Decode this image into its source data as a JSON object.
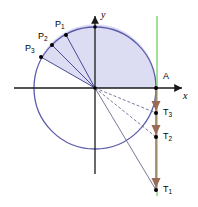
{
  "figure": {
    "type": "unit-circle-tangent-diagram",
    "width": 198,
    "height": 207,
    "background": "#ffffff"
  },
  "axes": {
    "x_label": "x",
    "y_label": "y",
    "origin": {
      "x": 95,
      "y": 88
    },
    "x_axis": {
      "x1": 14,
      "y1": 88,
      "x2": 186,
      "y2": 88
    },
    "y_axis": {
      "x1": 95,
      "y1": 172,
      "x2": 95,
      "y2": 12
    },
    "color": "#1a1a1a"
  },
  "circle": {
    "center_x": 95,
    "center_y": 88,
    "radius": 61,
    "stroke": "#5b5bac",
    "fill": "none"
  },
  "sector": {
    "fill": "#dcdcf2",
    "description": "shaded sector from P3 counterclockwise through top to point A"
  },
  "colors": {
    "circle_stroke": "#5b5bac",
    "sector_fill": "#dcdcf2",
    "radius_line": "#4a4a96",
    "dashed_ray": "#6a6a8c",
    "tangent_line": "#a0785f",
    "arrow_fill": "#9a6a55",
    "vertical_green": "#66cc55",
    "axis": "#1a1a1a",
    "point_dot": "#000000",
    "label_text": "#000000"
  },
  "points": [
    {
      "id": "P1",
      "label": "P",
      "sub": "1",
      "x": 66,
      "y": 35,
      "label_x": 55,
      "label_y": 20
    },
    {
      "id": "P2",
      "label": "P",
      "sub": "2",
      "x": 52,
      "y": 45,
      "label_x": 38,
      "label_y": 33
    },
    {
      "id": "P3",
      "label": "P",
      "sub": "3",
      "x": 41,
      "y": 57,
      "label_x": 26,
      "label_y": 45
    },
    {
      "id": "A",
      "label": "A",
      "sub": "",
      "x": 156,
      "y": 88,
      "label_x": 163,
      "label_y": 73
    },
    {
      "id": "T3",
      "label": "T",
      "sub": "3",
      "x": 156,
      "y": 113,
      "label_x": 163,
      "label_y": 109
    },
    {
      "id": "T2",
      "label": "T",
      "sub": "2",
      "x": 156,
      "y": 137,
      "label_x": 163,
      "label_y": 133
    },
    {
      "id": "T1",
      "label": "T",
      "sub": "1",
      "x": 156,
      "y": 190,
      "label_x": 163,
      "label_y": 186
    }
  ],
  "radii": [
    {
      "name": "radius-to-P1",
      "from": "origin",
      "to": "P1"
    },
    {
      "name": "radius-to-P2",
      "from": "origin",
      "to": "P2"
    },
    {
      "name": "radius-to-P3",
      "from": "origin",
      "to": "P3"
    }
  ],
  "rays": [
    {
      "name": "ray-to-T3",
      "from": "origin",
      "to": "T3"
    },
    {
      "name": "ray-to-T2",
      "from": "origin",
      "to": "T2"
    },
    {
      "name": "ray-to-T1",
      "from": "origin",
      "to": "T1"
    }
  ],
  "tangent_line": {
    "name": "vertical-tangent-at-A",
    "x": 156,
    "y_top": 88,
    "y_bottom": 192
  },
  "green_line": {
    "name": "vertical-green-guide",
    "x": 157,
    "y_top": 16,
    "y_bottom": 196
  },
  "arrow_markers": [
    {
      "name": "arrow-to-T3",
      "x": 156,
      "y": 108
    },
    {
      "name": "arrow-to-T2",
      "x": 156,
      "y": 132
    },
    {
      "name": "arrow-to-T1",
      "x": 156,
      "y": 185
    }
  ]
}
